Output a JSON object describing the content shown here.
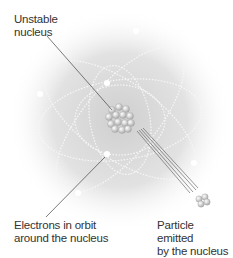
{
  "labels": {
    "nucleus": [
      "Unstable",
      "nucleus"
    ],
    "electrons": [
      "Electrons in orbit",
      "around the nucleus"
    ],
    "particle": [
      "Particle emitted",
      "by the nucleus"
    ]
  },
  "colors": {
    "halo": "#d8d8d8",
    "orbit": "#f4f4f4",
    "electron": "#ffffff",
    "nucleus": "#c8c8c8",
    "leader": "#444444",
    "text": "#333333"
  }
}
